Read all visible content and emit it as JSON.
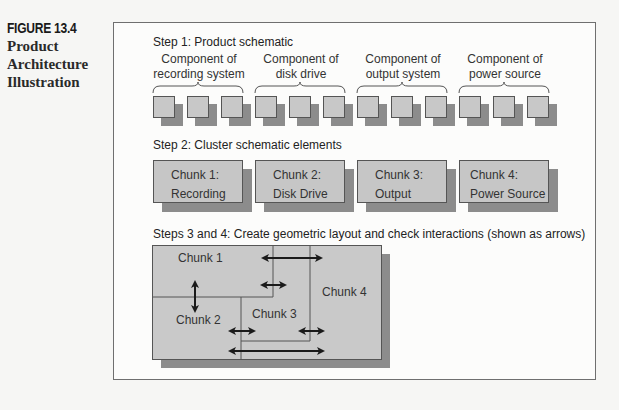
{
  "caption": {
    "figure_number": "FIGURE 13.4",
    "title_lines": [
      "Product",
      "Architecture",
      "Illustration"
    ]
  },
  "step1": {
    "heading": "Step 1: Product schematic",
    "groups": [
      {
        "line1": "Component of",
        "line2": "recording system",
        "count": 3
      },
      {
        "line1": "Component of",
        "line2": "disk drive",
        "count": 3
      },
      {
        "line1": "Component of",
        "line2": "output system",
        "count": 3
      },
      {
        "line1": "Component of",
        "line2": "power source",
        "count": 3
      }
    ]
  },
  "step2": {
    "heading": "Step 2: Cluster schematic elements",
    "chunks": [
      {
        "line1": "Chunk 1:",
        "line2": "Recording"
      },
      {
        "line1": "Chunk 2:",
        "line2": "Disk Drive"
      },
      {
        "line1": "Chunk 3:",
        "line2": "Output"
      },
      {
        "line1": "Chunk 4:",
        "line2": "Power Source"
      }
    ]
  },
  "step34": {
    "heading": "Steps 3 and 4: Create geometric layout and check interactions (shown as arrows)",
    "regions": [
      "Chunk 1",
      "Chunk 2",
      "Chunk 3",
      "Chunk 4"
    ],
    "interactions": [
      {
        "from": "Chunk 1",
        "to": "Chunk 4"
      },
      {
        "from": "Chunk 1",
        "to": "Chunk 3"
      },
      {
        "from": "Chunk 1",
        "to": "Chunk 2"
      },
      {
        "from": "Chunk 2",
        "to": "Chunk 3"
      },
      {
        "from": "Chunk 3",
        "to": "Chunk 4"
      },
      {
        "from": "Chunk 2",
        "to": "Chunk 4"
      }
    ]
  },
  "colors": {
    "component_face": "#c8c8c8",
    "shadow": "#8c8c8c",
    "layout_fill": "#c9c9c9",
    "line": "#555555",
    "arrow": "#1a1a1a"
  }
}
